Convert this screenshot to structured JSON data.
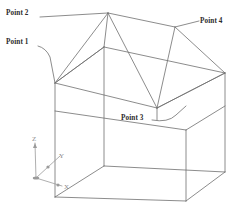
{
  "figure": {
    "background_color": "#ffffff",
    "line_color": "#6e6e6e",
    "label_color": "#2b2b2b",
    "axis_label_color": "#8a8a8a",
    "width": 241,
    "height": 211
  },
  "labels": {
    "point1": "Point 1",
    "point2": "Point 2",
    "point3": "Point 3",
    "point4": "Point 4"
  },
  "axes": {
    "x": "X",
    "y": "Y",
    "z": "Z"
  },
  "geometry": {
    "ridge_front": [
      108,
      13
    ],
    "ridge_back": [
      175,
      27
    ],
    "eave_front_left": [
      55,
      83
    ],
    "eave_front_right": [
      157,
      108
    ],
    "eave_back_left": [
      104,
      47
    ],
    "eave_back_right": [
      225,
      73
    ],
    "base_front_left": [
      55,
      197
    ],
    "base_front_right": [
      186,
      201
    ],
    "base_back_left": [
      104,
      166
    ],
    "base_back_right": [
      225,
      172
    ],
    "wall_mid_left": [
      55,
      111
    ],
    "wall_mid_right": [
      186,
      130
    ],
    "origin": [
      36,
      178
    ],
    "axis_x_tip": [
      62,
      186
    ],
    "axis_y_tip": [
      60,
      155
    ],
    "axis_z_tip": [
      35,
      143
    ]
  }
}
